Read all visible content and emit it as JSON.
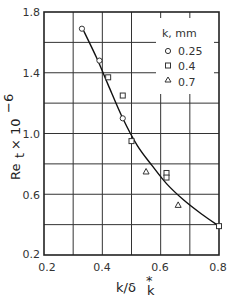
{
  "chart_data": {
    "type": "scatter",
    "title": "",
    "xlabel": "k/δ*_k",
    "ylabel": "Re_t × 10^-6",
    "xlim": [
      0.2,
      0.8
    ],
    "ylim": [
      0.2,
      1.8
    ],
    "grid": true,
    "x_ticks": [
      "0.2",
      "0.4",
      "0.6",
      "0.8"
    ],
    "y_ticks": [
      "0.2",
      "0.6",
      "1.0",
      "1.4",
      "1.8"
    ],
    "legend": {
      "title": "k, mm",
      "position": "upper right",
      "entries": [
        {
          "marker": "circle",
          "label": "0.25"
        },
        {
          "marker": "square",
          "label": "0.4"
        },
        {
          "marker": "triangle",
          "label": "0.7"
        }
      ]
    },
    "series": [
      {
        "name": "0.25",
        "marker": "circle",
        "x": [
          0.33,
          0.39,
          0.47
        ],
        "y": [
          1.69,
          1.48,
          1.1
        ]
      },
      {
        "name": "0.4",
        "marker": "square",
        "x": [
          0.42,
          0.47,
          0.5,
          0.62,
          0.62,
          0.8
        ],
        "y": [
          1.37,
          1.25,
          0.95,
          0.74,
          0.71,
          0.39
        ]
      },
      {
        "name": "0.7",
        "marker": "triangle",
        "x": [
          0.55,
          0.66
        ],
        "y": [
          0.75,
          0.53
        ]
      }
    ],
    "fit_curve": {
      "x": [
        0.33,
        0.38,
        0.42,
        0.47,
        0.52,
        0.57,
        0.62,
        0.68,
        0.74,
        0.8
      ],
      "y": [
        1.7,
        1.5,
        1.32,
        1.1,
        0.92,
        0.79,
        0.67,
        0.56,
        0.47,
        0.39
      ]
    }
  },
  "labels": {
    "x_axis": "k/δ",
    "x_axis_sup": "*",
    "x_axis_sub": "k",
    "y_axis_main": "Re",
    "y_axis_sub": "t",
    "y_axis_times": "× 10",
    "y_axis_exp": "−6",
    "legend_title": "k, mm",
    "legend_0": "0.25",
    "legend_1": "0.4",
    "legend_2": "0.7",
    "xt0": "0.2",
    "xt1": "0.4",
    "xt2": "0.6",
    "xt3": "0.8",
    "yt0": "0.2",
    "yt1": "0.6",
    "yt2": "1.0",
    "yt3": "1.4",
    "yt4": "1.8"
  }
}
